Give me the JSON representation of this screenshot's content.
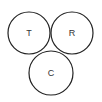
{
  "diagram": {
    "type": "three-circle-tangent",
    "stroke_color": "#222222",
    "text_color": "#333333",
    "circles": [
      {
        "label": "T",
        "cx": 29,
        "cy": 33,
        "r": 21
      },
      {
        "label": "R",
        "cx": 72,
        "cy": 33,
        "r": 21
      },
      {
        "label": "C",
        "cx": 51,
        "cy": 73,
        "r": 22
      }
    ]
  }
}
